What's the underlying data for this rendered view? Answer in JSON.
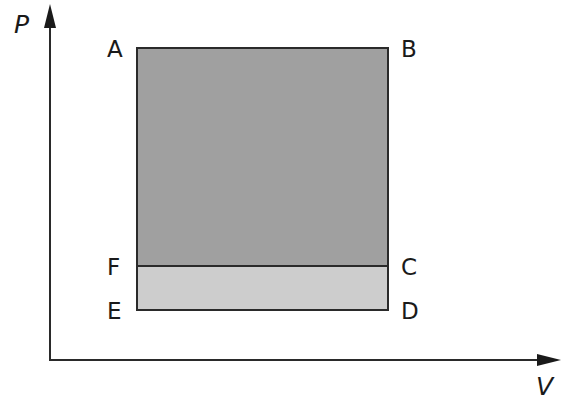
{
  "diagram": {
    "axes": {
      "y_label": "P",
      "x_label": "V"
    },
    "points": {
      "A": "A",
      "B": "B",
      "C": "C",
      "D": "D",
      "E": "E",
      "F": "F"
    },
    "regions": [
      {
        "name": "ABCF",
        "fill": "#a0a0a0"
      },
      {
        "name": "FCDE",
        "fill": "#cdcdcd"
      }
    ],
    "colors": {
      "stroke": "#2a2a2a",
      "upper_fill": "#a0a0a0",
      "lower_fill": "#cdcdcd",
      "background": "#ffffff"
    }
  }
}
